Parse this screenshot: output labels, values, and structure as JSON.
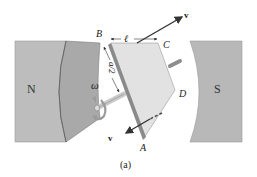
{
  "figure": {
    "caption": "(a)",
    "labels": {
      "north_pole": "N",
      "south_pole": "S",
      "corner_b": "B",
      "corner_c": "C",
      "corner_d": "D",
      "corner_a": "A",
      "length": "ℓ",
      "half_width": "a/2",
      "angular_velocity": "ω",
      "velocity_top": "v",
      "velocity_bottom": "v"
    },
    "colors": {
      "pole_face": "#b8b8b8",
      "pole_outer": "#bdbdbd",
      "pole_extension": "#a9a9a9",
      "loop_face": "#e2e2e2",
      "loop_edge": "#8a8a8a",
      "shaft": "#c9c9c9",
      "arrow": "#333333",
      "background": "#ffffff"
    }
  }
}
